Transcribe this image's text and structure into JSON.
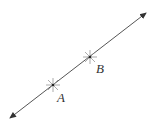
{
  "diagram": {
    "type": "line-through-two-points",
    "line": {
      "x1": 10,
      "y1": 118,
      "x2": 146,
      "y2": 13,
      "color": "#555555",
      "arrows": "both"
    },
    "points": [
      {
        "label": "A",
        "x": 53,
        "y": 85,
        "label_x": 57,
        "label_y": 91
      },
      {
        "label": "B",
        "x": 90,
        "y": 57,
        "label_x": 96,
        "label_y": 62
      }
    ]
  }
}
